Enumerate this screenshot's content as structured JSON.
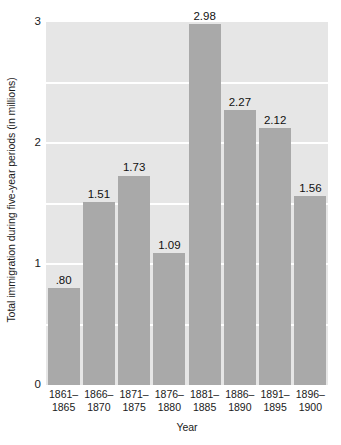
{
  "chart_data": {
    "type": "bar",
    "title": "",
    "subtitle": "",
    "xlabel": "Year",
    "ylabel": "Total immigration during five-year periods (in millions)",
    "categories": [
      "1861–1865",
      "1866–1870",
      "1871–1875",
      "1876–1880",
      "1881–1885",
      "1886–1890",
      "1891–1895",
      "1896–1900"
    ],
    "category_lines": [
      [
        "1861–",
        "1865"
      ],
      [
        "1866–",
        "1870"
      ],
      [
        "1871–",
        "1875"
      ],
      [
        "1876–",
        "1880"
      ],
      [
        "1881–",
        "1885"
      ],
      [
        "1886–",
        "1890"
      ],
      [
        "1891–",
        "1895"
      ],
      [
        "1896–",
        "1900"
      ]
    ],
    "values": [
      0.8,
      1.51,
      1.73,
      1.09,
      2.98,
      2.27,
      2.12,
      1.56
    ],
    "value_labels": [
      ".80",
      "1.51",
      "1.73",
      "1.09",
      "2.98",
      "2.27",
      "2.12",
      "1.56"
    ],
    "ylim": [
      0,
      3
    ],
    "yticks": [
      0,
      1,
      2,
      3
    ],
    "ytick_labels": [
      "0",
      "1",
      "2",
      "3"
    ],
    "gridlines": [
      0.5,
      1.0,
      1.5,
      2.0,
      2.5
    ],
    "grid": true,
    "legend": "none",
    "colors": {
      "bar": "#a9a9a9",
      "plot_background": "#e6e6e6",
      "gridline": "#ffffff",
      "text": "#1a1a1a",
      "page_background": "#ffffff"
    }
  }
}
